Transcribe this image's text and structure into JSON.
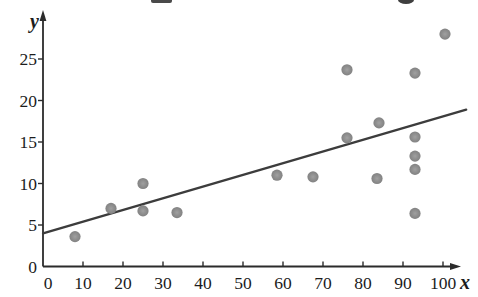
{
  "chart_data": {
    "type": "scatter",
    "title": "",
    "xlabel": "x",
    "ylabel": "y",
    "x_axis": {
      "ticks": [
        0,
        10,
        20,
        30,
        40,
        50,
        60,
        70,
        80,
        90,
        100
      ],
      "range": [
        0,
        104
      ],
      "tick_step": 10
    },
    "y_axis": {
      "ticks": [
        0,
        5,
        10,
        15,
        20,
        25
      ],
      "range": [
        0,
        30
      ],
      "tick_step": 5
    },
    "points": [
      [
        8,
        3.6
      ],
      [
        17,
        7.0
      ],
      [
        25,
        6.7
      ],
      [
        25,
        10.0
      ],
      [
        33.5,
        6.5
      ],
      [
        58.5,
        11.0
      ],
      [
        67.5,
        10.8
      ],
      [
        76,
        15.5
      ],
      [
        76,
        23.7
      ],
      [
        83.5,
        10.6
      ],
      [
        84,
        17.3
      ],
      [
        93,
        6.4
      ],
      [
        93,
        11.7
      ],
      [
        93,
        13.3
      ],
      [
        93,
        15.6
      ],
      [
        93,
        23.3
      ],
      [
        100.5,
        28.0
      ]
    ],
    "trend_line": {
      "x1": 0,
      "y1": 4.0,
      "x2": 105.8,
      "y2": 18.9
    },
    "grid": false,
    "legend": null,
    "colors": {
      "point": "#8f8f8f",
      "point_edge": "#828282",
      "trend": "#3c3c3c",
      "axis": "#2b2b2b",
      "text": "#1c1c1c",
      "background": "#ffffff"
    }
  }
}
